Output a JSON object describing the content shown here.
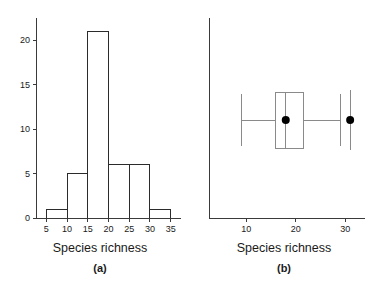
{
  "figure": {
    "width": 374,
    "height": 283,
    "background": "#ffffff",
    "ink_color": "#1a1a1a"
  },
  "panels": [
    {
      "id": "a",
      "caption": "(a)",
      "xlabel": "Species richness",
      "ylabel": ""
    },
    {
      "id": "b",
      "caption": "(b)",
      "xlabel": "Species richness",
      "ylabel": ""
    }
  ],
  "chart_data": [
    {
      "type": "bar",
      "subtype": "histogram",
      "panel": "a",
      "title": "",
      "xlabel": "Species richness",
      "ylabel": "",
      "xlim": [
        2.5,
        37.5
      ],
      "ylim": [
        0,
        22.5
      ],
      "grid": false,
      "legend": null,
      "xticks": [
        5,
        10,
        15,
        20,
        25,
        30,
        35
      ],
      "xtick_labels": [
        "5",
        "10",
        "15",
        "20",
        "25",
        "30",
        "35"
      ],
      "yticks": [
        0,
        5,
        10,
        15,
        20
      ],
      "ytick_labels": [
        "0",
        "5",
        "10",
        "15",
        "20"
      ],
      "bin_width": 5,
      "bin_edges": [
        5,
        10,
        15,
        20,
        25,
        30,
        35
      ],
      "categories": [
        "5-10",
        "10-15",
        "15-20",
        "20-25",
        "25-30",
        "30-35"
      ],
      "values": [
        1,
        5,
        21,
        6,
        6,
        1
      ]
    },
    {
      "type": "boxplot",
      "panel": "b",
      "title": "",
      "xlabel": "Species richness",
      "ylabel": "",
      "orientation": "horizontal",
      "xlim": [
        2.5,
        34
      ],
      "grid": false,
      "legend": null,
      "xticks": [
        10,
        20,
        30
      ],
      "xtick_labels": [
        "10",
        "20",
        "30"
      ],
      "box": {
        "whisker_low": 9,
        "q1": 16,
        "median": 18,
        "q3": 21.5,
        "whisker_high": 29,
        "mean": 18
      },
      "extra_points": [
        {
          "x": 31,
          "label": "outlier",
          "has_vertical_line": true
        }
      ]
    }
  ]
}
